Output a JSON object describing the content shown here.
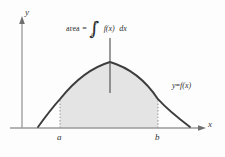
{
  "figure": {
    "title_label": "area = ∫ₐᵇ f(x) dx",
    "axes": {
      "y_label": "y",
      "x_label": "x",
      "x_axis_y": 128,
      "y_axis_x": 22,
      "origin": [
        22,
        128
      ]
    },
    "ticks": {
      "a_label": "a",
      "b_label": "b",
      "a_x": 60,
      "b_x": 158
    },
    "curve": {
      "label_y": "y",
      "label_eq": "=",
      "label_f": "f(x)",
      "color": "#3d3d3d",
      "x_left_root": 38,
      "x_right_root": 190,
      "peak": [
        110,
        62
      ]
    },
    "region": {
      "fill_color": "#e4e4e4",
      "from": "a",
      "to": "b"
    },
    "integral_label": {
      "word": "area",
      "equals": "=",
      "sign": "∫",
      "lower_limit": "a",
      "upper_limit": "b",
      "integrand": "f(x)",
      "differential": "dx"
    },
    "colors": {
      "axis": "#8e8e8e",
      "curve": "#3d3d3d",
      "fill": "#e4e4e4",
      "dotted": "#9a9a9a",
      "text": "#2f2f2f",
      "background": "#fdfdfd"
    }
  }
}
